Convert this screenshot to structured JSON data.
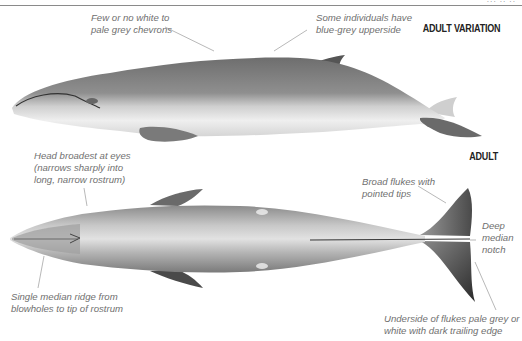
{
  "page": {
    "header_fragment": "··· ·· ··"
  },
  "sections": {
    "adult_variation": {
      "heading": "ADULT VARIATION",
      "view": "lateral",
      "annotations": [
        {
          "id": "chevrons",
          "lines": [
            "Few or no white to",
            "pale grey chevrons"
          ]
        },
        {
          "id": "upperside",
          "lines": [
            "Some individuals have",
            "blue-grey upperside"
          ]
        }
      ]
    },
    "adult": {
      "heading": "ADULT",
      "view": "dorsal",
      "annotations": [
        {
          "id": "head",
          "lines": [
            "Head broadest at eyes",
            "(narrows sharply into",
            "long, narrow rostrum)"
          ]
        },
        {
          "id": "flukes",
          "lines": [
            "Broad flukes with",
            "pointed tips"
          ]
        },
        {
          "id": "notch",
          "lines": [
            "Deep",
            "median",
            "notch"
          ]
        },
        {
          "id": "ridge",
          "lines": [
            "Single median ridge from",
            "blowholes to tip of rostrum"
          ]
        },
        {
          "id": "underside",
          "lines": [
            "Underside of flukes pale grey or",
            "white with dark trailing edge"
          ]
        }
      ]
    }
  },
  "colors": {
    "whale_dark": "#4a4a4a",
    "whale_mid": "#8c8c8c",
    "whale_light": "#e6e6e6",
    "label_text": "#6f6f6f",
    "heading_text": "#222222",
    "leader_line": "#9a9a9a"
  }
}
